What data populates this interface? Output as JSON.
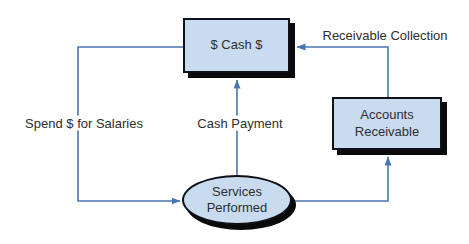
{
  "diagram": {
    "nodes": {
      "cash": {
        "label": "$ Cash $"
      },
      "accounts_receivable": {
        "label": "Accounts Receivable"
      },
      "services_performed": {
        "label": "Services Performed"
      }
    },
    "edges": {
      "receivable_collection": {
        "label": "Receivable Collection",
        "from": "accounts_receivable",
        "to": "cash"
      },
      "spend_for_salaries": {
        "label": "Spend $ for Salaries",
        "from": "cash",
        "to": "services_performed"
      },
      "cash_payment": {
        "label": "Cash Payment",
        "from": "services_performed",
        "to": "cash"
      },
      "services_to_receivable": {
        "label": "",
        "from": "services_performed",
        "to": "accounts_receivable"
      }
    },
    "colors": {
      "node_fill": "#c9dcef",
      "node_border": "#101018",
      "shadow": "#0a0a0a",
      "line": "#4a76ae",
      "text": "#2e2e2e",
      "background": "#ffffff"
    }
  }
}
